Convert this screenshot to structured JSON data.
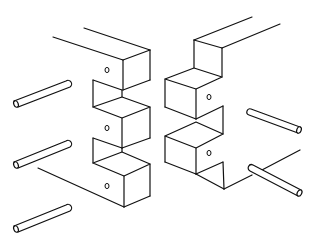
{
  "figure": {
    "line_color": "#111111",
    "background": "#ffffff",
    "left_piece": {
      "label": "left-finger-board",
      "fingers": 3,
      "holes": [
        [
          107,
          70
        ],
        [
          107,
          128
        ],
        [
          107,
          186
        ]
      ]
    },
    "right_piece": {
      "label": "right-finger-board",
      "fingers": 2,
      "holes": [
        [
          209,
          97
        ],
        [
          209,
          153
        ]
      ]
    },
    "dowels": {
      "left": [
        {
          "x1": 16,
          "y1": 104,
          "x2": 68,
          "y2": 84
        },
        {
          "x1": 16,
          "y1": 165,
          "x2": 68,
          "y2": 144
        },
        {
          "x1": 16,
          "y1": 229,
          "x2": 68,
          "y2": 208
        }
      ],
      "right": [
        {
          "x1": 250,
          "y1": 112,
          "x2": 300,
          "y2": 130
        },
        {
          "x1": 252,
          "y1": 168,
          "x2": 300,
          "y2": 193
        }
      ]
    }
  }
}
